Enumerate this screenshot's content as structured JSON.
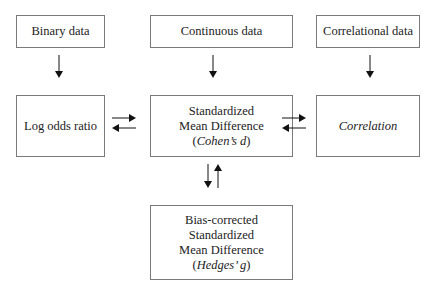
{
  "diagram": {
    "top_boxes": [
      {
        "id": "binary",
        "label": "Binary data"
      },
      {
        "id": "continuous",
        "label": "Continuous data"
      },
      {
        "id": "correlational",
        "label": "Correlational data"
      }
    ],
    "middle_boxes": {
      "log_odds": {
        "label": "Log odds ratio"
      },
      "smd": {
        "line1": "Standardized",
        "line2": "Mean Difference",
        "paren_open": "(",
        "italic": "Cohen’s d",
        "paren_close": ")"
      },
      "correlation": {
        "label": "Correlation"
      }
    },
    "bottom_box": {
      "line1": "Bias-corrected",
      "line2": "Standardized",
      "line3": "Mean Difference",
      "paren_open": "(",
      "italic": "Hedges’ g",
      "paren_close": ")"
    },
    "arrow_color": "#111111",
    "border_color": "#7a7a7a"
  }
}
